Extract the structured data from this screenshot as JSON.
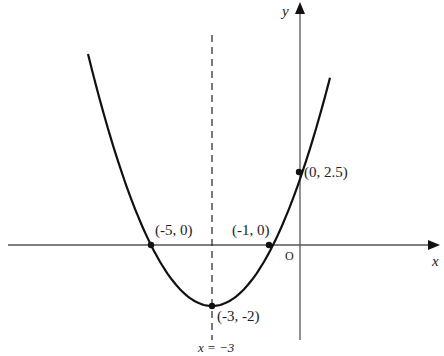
{
  "diagram": {
    "type": "parabola-graph",
    "equation_implied": "y = 0.5(x+3)^2 - 2",
    "axes": {
      "x_label": "x",
      "y_label": "y",
      "origin_label": "O"
    },
    "axis_of_symmetry": {
      "label": "x = −3",
      "value": -3,
      "style": "dashed"
    },
    "points": [
      {
        "label": "(-5, 0)",
        "x": -5,
        "y": 0
      },
      {
        "label": "(-1, 0)",
        "x": -1,
        "y": 0
      },
      {
        "label": "(-3, -2)",
        "x": -3,
        "y": -2
      },
      {
        "label": "(0, 2.5)",
        "x": 0,
        "y": 2.5
      }
    ],
    "colors": {
      "curve": "#111111",
      "axes": "#444444",
      "text": "#222222"
    }
  }
}
